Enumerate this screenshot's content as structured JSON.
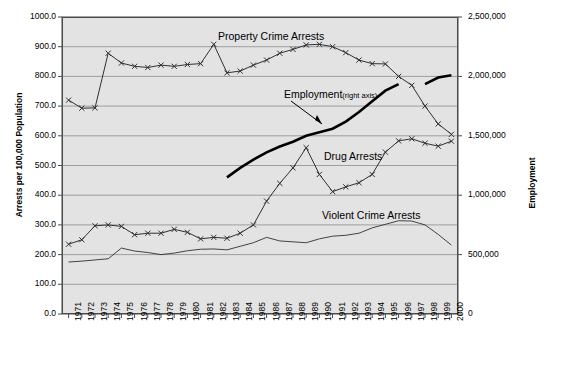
{
  "chart_data": {
    "type": "line",
    "title": "",
    "xlabel": "",
    "ylabel": "Arrests per 100,000 Population",
    "y2label": "Employment",
    "ylim": [
      0,
      1000
    ],
    "y2lim": [
      0,
      2500000
    ],
    "grid": true,
    "legend_position": "inline-annotations",
    "categories": [
      "1971",
      "1972",
      "1973",
      "1974",
      "1975",
      "1976",
      "1977",
      "1978",
      "1979",
      "1980",
      "1981",
      "1982",
      "1983",
      "1984",
      "1985",
      "1986",
      "1987",
      "1988",
      "1989",
      "1990",
      "1991",
      "1992",
      "1993",
      "1994",
      "1995",
      "1996",
      "1997",
      "1998",
      "1999",
      "2000"
    ],
    "yticks": [
      "0.0",
      "100.0",
      "200.0",
      "300.0",
      "400.0",
      "500.0",
      "600.0",
      "700.0",
      "800.0",
      "900.0",
      "1000.0"
    ],
    "y2ticks": [
      "0",
      "500,000",
      "1,000,000",
      "1,500,000",
      "2,000,000",
      "2,500,000"
    ],
    "series": [
      {
        "name": "Property Crime Arrests",
        "axis": "left",
        "marker": "x",
        "values": [
          720,
          693,
          694,
          878,
          845,
          834,
          830,
          838,
          834,
          840,
          843,
          908,
          812,
          818,
          838,
          855,
          878,
          891,
          906,
          908,
          900,
          880,
          855,
          843,
          842,
          800,
          770,
          700,
          640,
          605
        ]
      },
      {
        "name": "Drug Arrests",
        "axis": "left",
        "marker": "x",
        "values": [
          235,
          250,
          297,
          300,
          295,
          267,
          272,
          272,
          285,
          275,
          253,
          258,
          255,
          272,
          300,
          380,
          440,
          492,
          560,
          470,
          412,
          428,
          442,
          470,
          545,
          583,
          590,
          575,
          565,
          582
        ]
      },
      {
        "name": "Violent Crime Arrests",
        "axis": "left",
        "marker": "none",
        "values": [
          175,
          178,
          182,
          186,
          222,
          212,
          207,
          200,
          205,
          213,
          218,
          219,
          216,
          228,
          240,
          258,
          246,
          243,
          240,
          253,
          262,
          265,
          272,
          290,
          302,
          314,
          313,
          300,
          268,
          232
        ]
      },
      {
        "name": "Employment",
        "axis": "right",
        "marker": "none",
        "note": "thick line, break between 1996 and 1997",
        "segments": [
          {
            "start_year": "1983",
            "end_year": "1996",
            "values": [
              1150000,
              1230000,
              1300000,
              1360000,
              1410000,
              1450000,
              1500000,
              1530000,
              1560000,
              1620000,
              1700000,
              1790000,
              1880000,
              1935000
            ]
          },
          {
            "start_year": "1998",
            "end_year": "2000",
            "values": [
              1935000,
              1990000,
              2010000
            ]
          }
        ]
      }
    ],
    "annotations": [
      {
        "id": "property-label",
        "text": "Property Crime Arrests"
      },
      {
        "id": "employment-label",
        "text": "Employment",
        "sub": "(right axis)",
        "arrow": true
      },
      {
        "id": "drug-label",
        "text": "Drug Arrests"
      },
      {
        "id": "violent-label",
        "text": "Violent Crime Arrests"
      }
    ],
    "colors": {
      "plot_background": "#e3e3e3",
      "gridline": "#808080",
      "axis": "#4a4a4a",
      "series_line": "#303030",
      "employment_line": "#000000",
      "text": "#000000"
    }
  }
}
